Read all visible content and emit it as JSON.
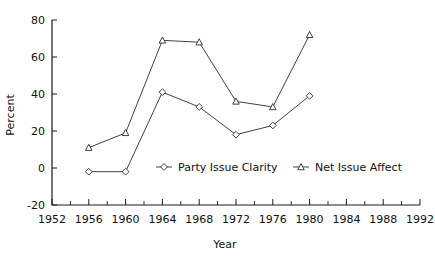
{
  "chart_data": {
    "type": "line",
    "title": "",
    "xlabel": "Year",
    "ylabel": "Percent",
    "x": [
      1956,
      1960,
      1964,
      1968,
      1972,
      1976,
      1980
    ],
    "xlim": [
      1952,
      1992
    ],
    "ylim": [
      -20,
      80
    ],
    "xticks": [
      1952,
      1956,
      1960,
      1964,
      1968,
      1972,
      1976,
      1980,
      1984,
      1988,
      1992
    ],
    "xtick_labels": [
      "1952",
      "1956",
      "1960",
      "1964",
      "1968",
      "1972",
      "1976",
      "1980",
      "1984",
      "1988",
      "1992"
    ],
    "x_minor_tick_step": 2,
    "yticks": [
      -20,
      0,
      20,
      40,
      60,
      80
    ],
    "ytick_labels": [
      "-20",
      "0",
      "20",
      "40",
      "60",
      "80"
    ],
    "grid": false,
    "legend_position": "inside-bottom-center",
    "series": [
      {
        "name": "Party Issue Clarity",
        "marker": "diamond",
        "color": "#2b2b2b",
        "values": [
          -2,
          -2,
          41,
          33,
          18,
          23,
          39
        ]
      },
      {
        "name": "Net Issue Affect",
        "marker": "triangle",
        "color": "#2b2b2b",
        "values": [
          11,
          19,
          69,
          68,
          36,
          33,
          72
        ]
      }
    ]
  },
  "axes": {
    "ylabel": "Percent",
    "xlabel": "Year"
  },
  "legend": {
    "items": [
      {
        "label": "Party Issue Clarity",
        "marker": "diamond"
      },
      {
        "label": "Net Issue Affect",
        "marker": "triangle"
      }
    ]
  }
}
